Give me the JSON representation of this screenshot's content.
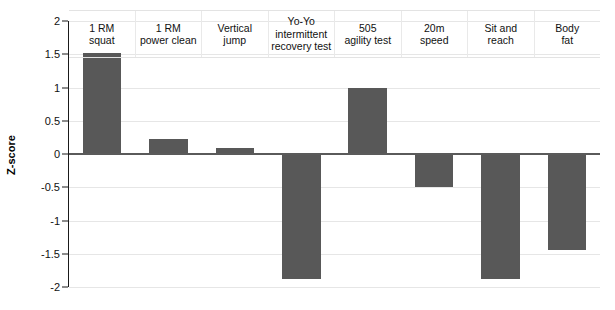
{
  "chart_data": {
    "type": "bar",
    "title": "",
    "subtitle": "",
    "xlabel": "",
    "ylabel": "Z-score",
    "ylim": [
      -2,
      2
    ],
    "yticks": [
      2,
      1.5,
      1,
      0.5,
      0,
      -0.5,
      -1,
      -1.5,
      -2
    ],
    "ytick_labels": [
      "2",
      "1.5",
      "1",
      "0.5",
      "0",
      "-0.5",
      "-1",
      "-1.5",
      "-2"
    ],
    "grid": true,
    "legend": false,
    "legend_position": "none",
    "bar_color": "#585858",
    "zero_line": true,
    "categories": [
      "1 RM squat",
      "1 RM power clean",
      "Vertical jump",
      "Yo-Yo intermittent recovery test",
      "505 agility test",
      "20m speed",
      "Sit and reach",
      "Body fat"
    ],
    "category_lines": [
      [
        "1 RM",
        "squat"
      ],
      [
        "1 RM",
        "power clean"
      ],
      [
        "Vertical",
        "jump"
      ],
      [
        "Yo-Yo",
        "intermittent",
        "recovery test"
      ],
      [
        "505",
        "agility test"
      ],
      [
        "20m",
        "speed"
      ],
      [
        "Sit and",
        "reach"
      ],
      [
        "Body",
        "fat"
      ]
    ],
    "values": [
      1.52,
      0.22,
      0.09,
      -1.88,
      1.0,
      -0.5,
      -1.88,
      -1.45
    ]
  }
}
